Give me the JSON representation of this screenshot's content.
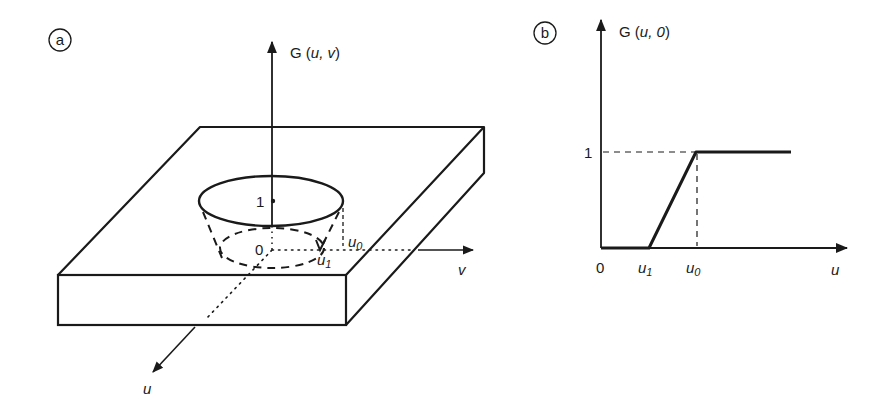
{
  "panel_a": {
    "tag": "a",
    "vertical_axis_label": "G",
    "vertical_axis_args": "u, v",
    "tick_one": "1",
    "origin": "0",
    "u0_label": "u",
    "u0_sub": "0",
    "u1_label": "u",
    "u1_sub": "1",
    "v_axis_label": "v",
    "u_axis_label": "u"
  },
  "panel_b": {
    "tag": "b",
    "y_axis_label": "G",
    "y_axis_args": "u, 0",
    "y_tick": "1",
    "origin": "0",
    "x_ticks": [
      {
        "label": "u",
        "sub": "1"
      },
      {
        "label": "u",
        "sub": "0"
      }
    ],
    "x_axis_label": "u"
  },
  "colors": {
    "ink": "#1a1a1a",
    "background": "#ffffff"
  }
}
